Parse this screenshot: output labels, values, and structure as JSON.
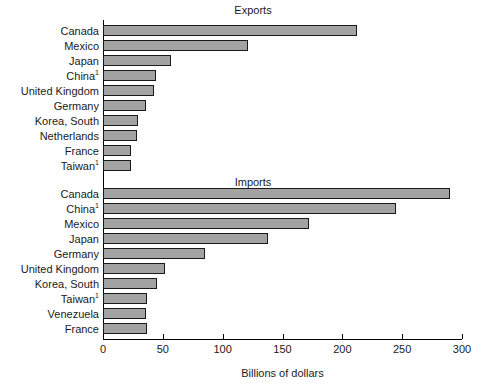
{
  "chart_data": {
    "type": "bar",
    "orientation": "horizontal",
    "title": "",
    "xlabel": "Billions of dollars",
    "ylabel": "",
    "xlim": [
      0,
      300
    ],
    "xticks": [
      0,
      50,
      100,
      150,
      200,
      250,
      300
    ],
    "grid": false,
    "legend": null,
    "bar_color": "#a3a3a3",
    "bar_edge_color": "#1a1a1a",
    "panels": [
      {
        "name": "exports",
        "title": "Exports",
        "categories": [
          "Canada",
          "Mexico",
          "Japan",
          "China<sup>1</sup>",
          "United Kingdom",
          "Germany",
          "Korea, South",
          "Netherlands",
          "France",
          "Taiwan<sup>1</sup>"
        ],
        "values": [
          212,
          121,
          57,
          44,
          43,
          36,
          29,
          28,
          23,
          23
        ]
      },
      {
        "name": "imports",
        "title": "Imports",
        "categories": [
          "Canada",
          "China<sup>1</sup>",
          "Mexico",
          "Japan",
          "Germany",
          "United Kingdom",
          "Korea, South",
          "Taiwan<sup>1</sup>",
          "Venezuela",
          "France"
        ],
        "values": [
          290,
          245,
          172,
          138,
          85,
          52,
          45,
          37,
          36,
          37
        ]
      }
    ]
  },
  "axis": {
    "tick_labels": [
      "0",
      "50",
      "100",
      "150",
      "200",
      "250",
      "300"
    ],
    "x_axis_label": "Billions of dollars"
  },
  "titles": {
    "exports": "Exports",
    "imports": "Imports"
  }
}
